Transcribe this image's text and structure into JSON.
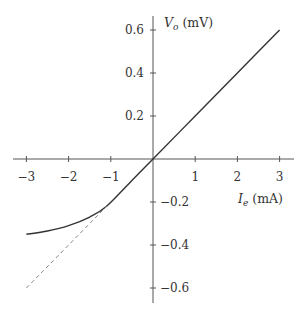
{
  "chart_data": {
    "type": "line",
    "title": "",
    "xlabel": "I_e (mA)",
    "ylabel": "V_o (mV)",
    "xlabel_parts": {
      "symbol": "I",
      "sub": "e",
      "unit": " (mA)"
    },
    "ylabel_parts": {
      "symbol": "V",
      "sub": "o",
      "unit": " (mV)"
    },
    "xlim": [
      -3.3,
      3.3
    ],
    "ylim": [
      -0.67,
      0.67
    ],
    "grid": false,
    "legend": null,
    "x_ticks": [
      -3,
      -2,
      -1,
      1,
      2,
      3
    ],
    "x_tick_labels": [
      "−3",
      "−2",
      "−1",
      "1",
      "2",
      "3"
    ],
    "y_ticks": [
      0.6,
      0.4,
      0.2,
      -0.2,
      -0.4,
      -0.6
    ],
    "y_tick_labels": [
      "0.6",
      "0.4",
      "0.2",
      "−0.2",
      "−0.4",
      "−0.6"
    ],
    "series": [
      {
        "name": "actual output (solid)",
        "style": "solid",
        "color": "#333333",
        "x": [
          -3.0,
          -2.5,
          -2.0,
          -1.5,
          -1.1,
          -0.5,
          0,
          1,
          2,
          3
        ],
        "y": [
          -0.35,
          -0.335,
          -0.31,
          -0.27,
          -0.22,
          -0.1,
          0,
          0.2,
          0.4,
          0.6
        ]
      },
      {
        "name": "linear extrapolation (dashed)",
        "style": "dashed",
        "color": "#888888",
        "x": [
          -3.0,
          -1.1
        ],
        "y": [
          -0.6,
          -0.22
        ]
      }
    ]
  }
}
